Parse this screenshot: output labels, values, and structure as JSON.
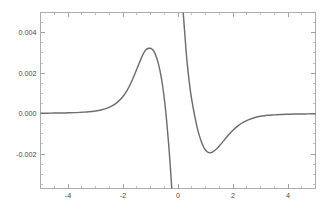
{
  "figure": {
    "background_color": "#ffffff",
    "frame_color": "#9a9a9a",
    "curve_color": "#6e6e6e",
    "tick_label_color": "#4a4a4a"
  },
  "chart_data": {
    "type": "line",
    "title": "",
    "subtitle": "",
    "xlabel": "",
    "ylabel": "",
    "xlim": [
      -5,
      5
    ],
    "ylim": [
      -0.0037,
      0.005
    ],
    "grid": false,
    "legend": null,
    "legend_position": "none",
    "annotations": [],
    "x_ticks_major": [
      -4,
      -2,
      0,
      2,
      4
    ],
    "x_tick_labels": [
      "-4",
      "-2",
      "0",
      "2",
      "4"
    ],
    "x_ticks_minor": [
      -4.5,
      -3.5,
      -3,
      -2.5,
      -1.5,
      -1,
      -0.5,
      0.5,
      1,
      1.5,
      2.5,
      3,
      3.5,
      4.5
    ],
    "y_ticks_major": [
      0.004,
      0.002,
      0.0,
      -0.002
    ],
    "y_tick_labels": [
      "0.004",
      "0.002",
      "0.000",
      "-0.002"
    ],
    "y_ticks_minor": [
      0.0045,
      0.0035,
      0.003,
      0.0025,
      0.0015,
      0.001,
      0.0005,
      -0.0005,
      -0.001,
      -0.0015,
      -0.0025,
      -0.003,
      -0.0035
    ],
    "discontinuity_x": 0,
    "features": {
      "local_maximum": {
        "x": -1.0,
        "y": 0.0032
      },
      "local_minimum": {
        "x": 1.1,
        "y": -0.0019
      },
      "pole": {
        "x": 0.0,
        "description": "vertical asymptote"
      }
    },
    "series": [
      {
        "name": "branch-left",
        "x": [
          -5.0,
          -4.75,
          -4.5,
          -4.25,
          -4.0,
          -3.75,
          -3.5,
          -3.25,
          -3.0,
          -2.8,
          -2.6,
          -2.4,
          -2.2,
          -2.0,
          -1.85,
          -1.7,
          -1.55,
          -1.4,
          -1.3,
          -1.2,
          -1.1,
          -1.0,
          -0.92,
          -0.85,
          -0.78,
          -0.7,
          -0.62,
          -0.55,
          -0.48,
          -0.42,
          -0.36,
          -0.3,
          -0.25,
          -0.2,
          -0.16,
          -0.12,
          -0.09,
          -0.06,
          -0.04,
          -0.025,
          -0.015
        ],
        "y": [
          2e-05,
          2e-05,
          3e-05,
          3e-05,
          4e-05,
          5e-05,
          7e-05,
          9e-05,
          0.00013,
          0.00018,
          0.00026,
          0.00038,
          0.00057,
          0.00085,
          0.00115,
          0.00155,
          0.00203,
          0.00253,
          0.00285,
          0.0031,
          0.00322,
          0.00323,
          0.00316,
          0.00302,
          0.00278,
          0.0024,
          0.00188,
          0.00128,
          0.00054,
          -0.00026,
          -0.00118,
          -0.00222,
          -0.00322,
          -0.00427,
          -0.0052,
          -0.0061,
          -0.0068,
          -0.00745,
          -0.0079,
          -0.00825,
          -0.0085
        ]
      },
      {
        "name": "branch-right",
        "x": [
          0.015,
          0.025,
          0.04,
          0.06,
          0.09,
          0.12,
          0.16,
          0.2,
          0.25,
          0.3,
          0.36,
          0.42,
          0.48,
          0.55,
          0.62,
          0.7,
          0.78,
          0.86,
          0.95,
          1.05,
          1.15,
          1.25,
          1.4,
          1.55,
          1.7,
          1.85,
          2.0,
          2.2,
          2.4,
          2.6,
          2.8,
          3.0,
          3.25,
          3.5,
          3.75,
          4.0,
          4.25,
          4.5,
          4.75,
          5.0
        ],
        "y": [
          0.0095,
          0.009,
          0.0085,
          0.008,
          0.0072,
          0.0065,
          0.0056,
          0.0048,
          0.0039,
          0.003,
          0.00215,
          0.00145,
          0.00085,
          0.0003,
          -0.0002,
          -0.0007,
          -0.0011,
          -0.00143,
          -0.0017,
          -0.00187,
          -0.00193,
          -0.0019,
          -0.00175,
          -0.00152,
          -0.00127,
          -0.00103,
          -0.00082,
          -0.00058,
          -0.00041,
          -0.00028,
          -0.00019,
          -0.00013,
          -8e-05,
          -6e-05,
          -4e-05,
          -3e-05,
          -2e-05,
          -2e-05,
          -1e-05,
          -1e-05
        ]
      }
    ]
  }
}
